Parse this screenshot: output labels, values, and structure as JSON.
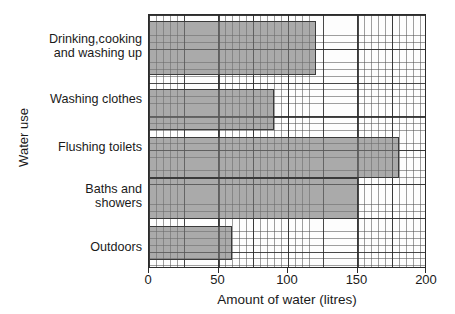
{
  "chart_data": {
    "type": "bar",
    "orientation": "horizontal",
    "title": "",
    "xlabel": "Amount of water (litres)",
    "ylabel": "Water use",
    "categories": [
      "Drinking,cooking\nand washing up",
      "Washing clothes",
      "Flushing toilets",
      "Baths and\nshowers",
      "Outdoors"
    ],
    "values": [
      120,
      90,
      180,
      150,
      60
    ],
    "xlim": [
      0,
      200
    ],
    "xticks": [
      0,
      50,
      100,
      150,
      200
    ],
    "xtick_labels": [
      "0",
      "50",
      "100",
      "150",
      "200"
    ],
    "grid": true,
    "grid_minor_step": 5,
    "grid_major_step": 25,
    "legend": "none",
    "bar_fill_color": "#8a8a8a",
    "bar_border_color": "#3a3a3a",
    "axis_color": "#2b2b2b",
    "background_color": "#ffffff"
  },
  "axes": {
    "x_title": "Amount of water (litres)",
    "y_title": "Water use"
  },
  "category_labels": [
    {
      "line1": "Drinking,cooking",
      "line2": "and washing up"
    },
    {
      "line1": "Washing clothes",
      "line2": ""
    },
    {
      "line1": "Flushing toilets",
      "line2": ""
    },
    {
      "line1": "Baths and",
      "line2": "showers"
    },
    {
      "line1": "Outdoors",
      "line2": ""
    }
  ],
  "tick_labels": [
    "0",
    "50",
    "100",
    "150",
    "200"
  ]
}
